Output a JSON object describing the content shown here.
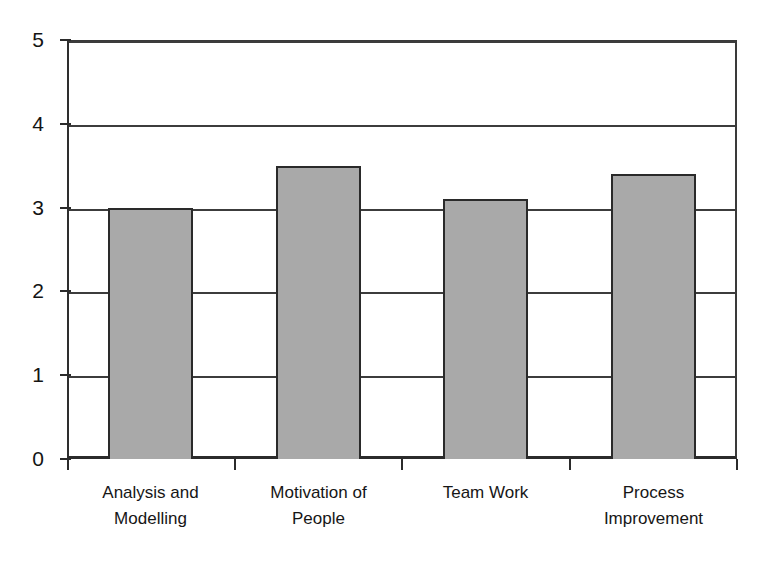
{
  "chart_data": {
    "type": "bar",
    "title": "",
    "subtitle": "",
    "xlabel": "",
    "ylabel": "",
    "categories": [
      "Analysis and Modelling",
      "Motivation of People",
      "Team Work",
      "Process Improvement"
    ],
    "category_lines": [
      [
        "Analysis and",
        "Modelling"
      ],
      [
        "Motivation of",
        "People"
      ],
      [
        "Team Work",
        ""
      ],
      [
        "Process",
        "Improvement"
      ]
    ],
    "values": [
      3.0,
      3.5,
      3.1,
      3.4
    ],
    "ylim": [
      0,
      5
    ],
    "ytick_labels": [
      "0",
      "1",
      "2",
      "3",
      "4",
      "5"
    ],
    "ytick_values": [
      0,
      1,
      2,
      3,
      4,
      5
    ],
    "grid": "horizontal",
    "gridlines_at": [
      1,
      2,
      3,
      4,
      5
    ],
    "legend": "none",
    "legend_position": "none",
    "bar_fill_color": "#a9a9a9",
    "bar_border_color": "#2a2a2a",
    "axis_color": "#2b2b2b",
    "gridline_color": "#3c3c3c",
    "background_color": "#ffffff"
  }
}
